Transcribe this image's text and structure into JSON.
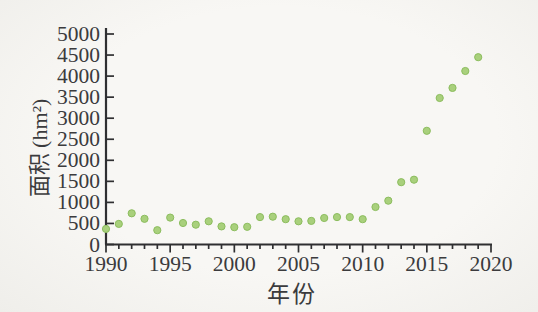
{
  "figure": {
    "background_color": "#f6f5f2",
    "axis_color": "#2f2f31",
    "text_color": "#3b3b3d"
  },
  "chart_data": {
    "type": "scatter",
    "title": "",
    "xlabel": "年份",
    "ylabel": "面积 (hm²)",
    "xlim": [
      1990,
      2020
    ],
    "ylim": [
      0,
      5000
    ],
    "grid": false,
    "legend": false,
    "x_major_ticks": [
      1990,
      1995,
      2000,
      2005,
      2010,
      2015,
      2020
    ],
    "x_minor_tick_step": 1,
    "y_ticks": [
      0,
      500,
      1000,
      1500,
      2000,
      2500,
      3000,
      3500,
      4000,
      4500,
      5000
    ],
    "point_color": "#a9d07c",
    "point_edge_color": "#8cbd5e",
    "x": [
      1990,
      1991,
      1992,
      1993,
      1994,
      1995,
      1996,
      1997,
      1998,
      1999,
      2000,
      2001,
      2002,
      2003,
      2004,
      2005,
      2006,
      2007,
      2008,
      2009,
      2010,
      2011,
      2012,
      2013,
      2014,
      2015,
      2016,
      2017,
      2018,
      2019
    ],
    "values": [
      370,
      490,
      740,
      610,
      340,
      640,
      510,
      470,
      550,
      430,
      410,
      420,
      650,
      660,
      600,
      550,
      560,
      630,
      650,
      650,
      600,
      890,
      1040,
      1480,
      1540,
      2700,
      3480,
      3720,
      4120,
      4450
    ]
  }
}
